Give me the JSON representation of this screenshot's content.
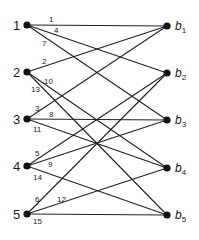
{
  "diagram": {
    "type": "bipartite-graph",
    "style": {
      "line_color": "#222222",
      "node_color": "#111111",
      "background": "#ffffff"
    },
    "left_nodes": [
      {
        "id": "1",
        "label": "1",
        "x": 27,
        "y": 25
      },
      {
        "id": "2",
        "label": "2",
        "x": 27,
        "y": 72
      },
      {
        "id": "3",
        "label": "3",
        "x": 27,
        "y": 119
      },
      {
        "id": "4",
        "label": "4",
        "x": 27,
        "y": 166
      },
      {
        "id": "5",
        "label": "5",
        "x": 27,
        "y": 214
      }
    ],
    "right_nodes": [
      {
        "id": "b1",
        "label": "b",
        "sub": "1",
        "x": 167,
        "y": 26
      },
      {
        "id": "b2",
        "label": "b",
        "sub": "2",
        "x": 167,
        "y": 73
      },
      {
        "id": "b3",
        "label": "b",
        "sub": "3",
        "x": 167,
        "y": 120
      },
      {
        "id": "b4",
        "label": "b",
        "sub": "4",
        "x": 167,
        "y": 168
      },
      {
        "id": "b5",
        "label": "b",
        "sub": "5",
        "x": 167,
        "y": 215
      }
    ],
    "edges": [
      {
        "label": "1",
        "from": "1",
        "to": "b1",
        "lx": 49,
        "ly": 22
      },
      {
        "label": "4",
        "from": "1",
        "to": "b2",
        "lx": 54,
        "ly": 33
      },
      {
        "label": "7",
        "from": "1",
        "to": "b3",
        "lx": 42,
        "ly": 46
      },
      {
        "label": "2",
        "from": "2",
        "to": "b1",
        "lx": 42,
        "ly": 64
      },
      {
        "label": "10",
        "from": "2",
        "to": "b4",
        "lx": 44,
        "ly": 84
      },
      {
        "label": "13",
        "from": "2",
        "to": "b5",
        "lx": 31,
        "ly": 92
      },
      {
        "label": "3",
        "from": "3",
        "to": "b1",
        "lx": 35,
        "ly": 111
      },
      {
        "label": "8",
        "from": "3",
        "to": "b3",
        "lx": 49,
        "ly": 117
      },
      {
        "label": "11",
        "from": "3",
        "to": "b4",
        "lx": 33,
        "ly": 132
      },
      {
        "label": "5",
        "from": "4",
        "to": "b2",
        "lx": 35,
        "ly": 156
      },
      {
        "label": "9",
        "from": "4",
        "to": "b3",
        "lx": 48,
        "ly": 167
      },
      {
        "label": "14",
        "from": "4",
        "to": "b5",
        "lx": 33,
        "ly": 180
      },
      {
        "label": "6",
        "from": "5",
        "to": "b2",
        "lx": 35,
        "ly": 202
      },
      {
        "label": "12",
        "from": "5",
        "to": "b4",
        "lx": 57,
        "ly": 202
      },
      {
        "label": "15",
        "from": "5",
        "to": "b5",
        "lx": 33,
        "ly": 224
      }
    ]
  }
}
